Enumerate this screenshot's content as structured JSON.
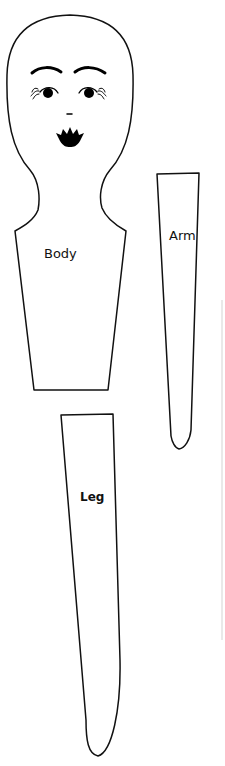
{
  "pattern": {
    "pieces": [
      {
        "id": "body",
        "label": "Body"
      },
      {
        "id": "arm",
        "label": "Arm"
      },
      {
        "id": "leg",
        "label": "Leg"
      }
    ],
    "colors": {
      "outline": "#111111",
      "background": "#ffffff",
      "face_features": "#000000"
    }
  }
}
